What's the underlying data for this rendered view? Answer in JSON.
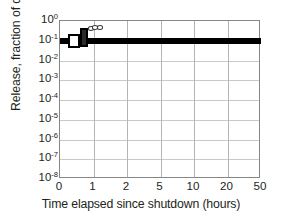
{
  "chart_data": {
    "type": "line",
    "title": "",
    "xlabel": "Time elapsed since shutdown (hours)",
    "ylabel": "Release, fraction of core inventory",
    "xticks": [
      0,
      1,
      2,
      5,
      10,
      20,
      50
    ],
    "xtick_labels": [
      "0",
      "1",
      "2",
      "5",
      "10",
      "20",
      "50"
    ],
    "yticks": [
      1,
      0.1,
      0.01,
      0.001,
      0.0001,
      1e-05,
      1e-06,
      1e-07,
      1e-08
    ],
    "ytick_labels": [
      "10<sup>0</sup>",
      "10<sup>-1</sup>",
      "10<sup>-2</sup>",
      "10<sup>-3</sup>",
      "10<sup>-4</sup>",
      "10<sup>-5</sup>",
      "10<sup>-6</sup>",
      "10<sup>-7</sup>",
      "10<sup>-8</sup>"
    ],
    "ytick_plain": [
      "10^0",
      "10^-1",
      "10^-2",
      "10^-3",
      "10^-4",
      "10^-5",
      "10^-6",
      "10^-7",
      "10^-8"
    ],
    "yscale": "log",
    "ylim": [
      1e-08,
      1
    ],
    "xscale": "compressed-nonlinear",
    "grid": true,
    "legend": "none",
    "series": [
      {
        "name": "release-band",
        "style": "thick-black-horizontal-band",
        "description": "Heavy black line spanning full x range at ~1e-1",
        "x": [
          0,
          1,
          2,
          5,
          10,
          20,
          50
        ],
        "values": [
          0.1,
          0.1,
          0.1,
          0.1,
          0.1,
          0.1,
          0.1
        ]
      },
      {
        "name": "step-marker",
        "style": "open-rectangle-step",
        "description": "Open rectangle step rising from ~1e-1 to ~4e-1 between 0.25 and 0.85 hours",
        "x": [
          0.25,
          0.6,
          0.6,
          0.85
        ],
        "values": [
          0.1,
          0.1,
          0.4,
          0.4
        ]
      },
      {
        "name": "circle-markers",
        "style": "open-circles",
        "description": "Three small open circles just above the band near 1 hour",
        "x": [
          0.92,
          1.05,
          1.2
        ],
        "values": [
          0.42,
          0.45,
          0.48
        ]
      }
    ],
    "colors": {
      "data": "#000000",
      "grid": "#c9c9c9",
      "frame": "#868686",
      "text": "#231f20",
      "background": "#ffffff"
    }
  }
}
